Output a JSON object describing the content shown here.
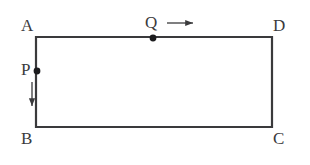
{
  "figure": {
    "background_color": "#ffffff",
    "stroke_color": "#3a3a3c",
    "label_color": "#3a3a3c",
    "width": 310,
    "height": 165,
    "shape": {
      "name": "rectangle",
      "vertices": [
        {
          "id": "A",
          "label": "A",
          "x": 36,
          "y": 37
        },
        {
          "id": "D",
          "label": "D",
          "x": 272,
          "y": 37
        },
        {
          "id": "C",
          "label": "C",
          "x": 272,
          "y": 127
        },
        {
          "id": "B",
          "label": "B",
          "x": 36,
          "y": 127
        }
      ],
      "path": "M 36 37 L 272 37 L 272 127 L 36 127 Z"
    },
    "points": [
      {
        "id": "Q",
        "label": "Q",
        "x": 153,
        "y": 38,
        "on_edge": "AD",
        "marker": "filled-dot",
        "radius": 3.4
      },
      {
        "id": "P",
        "label": "P",
        "x": 37,
        "y": 71,
        "on_edge": "AB",
        "marker": "filled-dot",
        "radius": 3.4
      }
    ],
    "arrows": [
      {
        "id": "arrow-Q",
        "direction": "right",
        "for_point": "Q",
        "x1": 167,
        "y1": 23,
        "x2": 196,
        "y2": 23
      },
      {
        "id": "arrow-P",
        "direction": "down",
        "for_point": "P",
        "x1": 32,
        "y1": 82,
        "x2": 32,
        "y2": 109
      }
    ]
  }
}
